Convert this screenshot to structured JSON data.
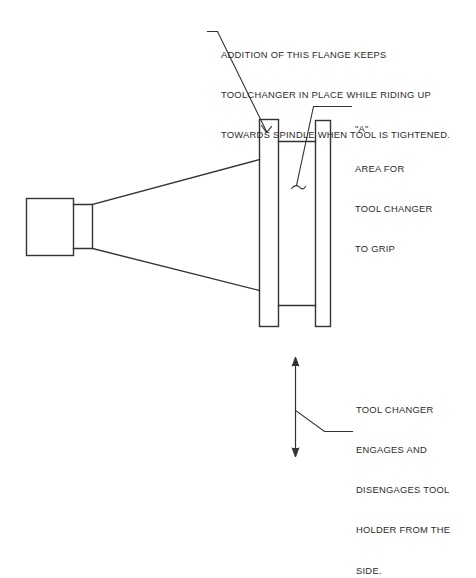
{
  "drawing": {
    "title": "Tool Holder With Added Flange - Tool Changer Engagement Diagram",
    "background_color": "#ffffff",
    "line_color": "#333333",
    "text_color": "#2b2b2b"
  },
  "annotations": {
    "flange_note": {
      "id": "flange-note",
      "lines": [
        "ADDITION OF THIS FLANGE KEEPS",
        "TOOLCHANGER IN PLACE WHILE RIDING UP",
        "TOWARDS SPINDLE WHEN TOOL IS TIGHTENED."
      ]
    },
    "grip_note": {
      "id": "grip-note",
      "lines": [
        "\"A\"",
        "AREA FOR",
        "TOOL CHANGER",
        "TO GRIP"
      ]
    },
    "side_note": {
      "id": "side-note",
      "lines": [
        "TOOL CHANGER",
        "ENGAGES AND",
        "DISENGAGES TOOL",
        "HOLDER FROM THE",
        "SIDE."
      ]
    }
  },
  "parts": {
    "pull_stud_block": {
      "label": "pull-stud-block"
    },
    "neck": {
      "label": "retention-neck"
    },
    "taper_body": {
      "label": "taper-body"
    },
    "added_flange": {
      "label": "added-flange"
    },
    "grip_groove": {
      "label": "grip-groove-area-a"
    },
    "outer_flange": {
      "label": "outer-flange"
    },
    "motion_arrow": {
      "label": "vertical-motion-arrow"
    }
  }
}
